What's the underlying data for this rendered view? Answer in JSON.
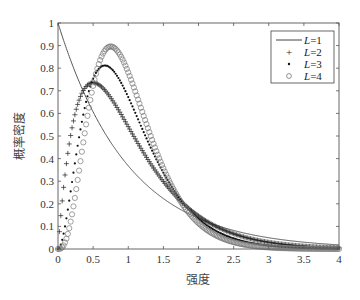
{
  "chart_data": {
    "type": "line",
    "title": "",
    "xlabel": "强度",
    "ylabel": "概率密度",
    "xlim": [
      0,
      4
    ],
    "ylim": [
      0,
      1
    ],
    "xticks": [
      0,
      0.5,
      1,
      1.5,
      2,
      2.5,
      3,
      3.5,
      4
    ],
    "xtick_labels": [
      "0",
      "0.5",
      "1",
      "1.5",
      "2",
      "2.5",
      "3",
      "3.5",
      "4"
    ],
    "yticks": [
      0,
      0.1,
      0.2,
      0.3,
      0.4,
      0.5,
      0.6,
      0.7,
      0.8,
      0.9,
      1
    ],
    "ytick_labels": [
      "0",
      "0.1",
      "0.2",
      "0.3",
      "0.4",
      "0.5",
      "0.6",
      "0.7",
      "0.8",
      "0.9",
      "1"
    ],
    "grid": false,
    "legend_position": "upper right",
    "x": [
      0,
      0.25,
      0.5,
      0.75,
      1,
      1.25,
      1.5,
      1.75,
      2,
      2.5,
      3,
      3.5,
      4
    ],
    "series": [
      {
        "name": "L=1",
        "shape_L": 1,
        "style": "line",
        "marker": "",
        "values": [
          1.0,
          0.779,
          0.607,
          0.472,
          0.368,
          0.287,
          0.223,
          0.174,
          0.135,
          0.082,
          0.05,
          0.03,
          0.018
        ]
      },
      {
        "name": "L=2",
        "shape_L": 2,
        "style": "marker",
        "marker": "+",
        "values": [
          0.0,
          0.607,
          0.736,
          0.669,
          0.541,
          0.41,
          0.299,
          0.211,
          0.147,
          0.067,
          0.03,
          0.013,
          0.005
        ]
      },
      {
        "name": "L=3",
        "shape_L": 3,
        "style": "marker",
        "marker": ".",
        "values": [
          0.0,
          0.398,
          0.753,
          0.797,
          0.672,
          0.497,
          0.337,
          0.217,
          0.134,
          0.047,
          0.015,
          0.005,
          0.001
        ]
      },
      {
        "name": "L=4",
        "shape_L": 4,
        "style": "marker",
        "marker": "o",
        "values": [
          0.0,
          0.245,
          0.721,
          0.896,
          0.781,
          0.56,
          0.355,
          0.208,
          0.115,
          0.03,
          0.007,
          0.002,
          0.0
        ]
      }
    ],
    "peaks": [
      {
        "series": "L=2",
        "x": 0.5,
        "y": 0.74
      },
      {
        "series": "L=3",
        "x": 0.67,
        "y": 0.81
      },
      {
        "series": "L=4",
        "x": 0.75,
        "y": 0.9
      }
    ]
  },
  "legend": {
    "items": [
      {
        "prefix": "L",
        "suffix": "=1",
        "symbol": "line"
      },
      {
        "prefix": "L",
        "suffix": "=2",
        "symbol": "+"
      },
      {
        "prefix": "L",
        "suffix": "=3",
        "symbol": "·"
      },
      {
        "prefix": "L",
        "suffix": "=4",
        "symbol": "○"
      }
    ]
  },
  "colors": {
    "axis": "#555555",
    "line_L1": "#555555",
    "marker_L2": "#222222",
    "marker_L3": "#111111",
    "marker_L4": "#777777"
  }
}
